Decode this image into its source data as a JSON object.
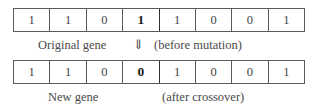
{
  "figure": {
    "colors": {
      "background": "#ffffff",
      "border": "#5b5b5b",
      "text": "#4a4a4a",
      "highlight": "#1d1d1d"
    }
  },
  "original": {
    "label": "Original gene",
    "note": "(before mutation)",
    "arrow_icon": "double-down-arrow",
    "arrow_glyph": "⇓",
    "mutated_index": 3,
    "bits": [
      "1",
      "1",
      "0",
      "1",
      "1",
      "0",
      "0",
      "1"
    ]
  },
  "new": {
    "label": "New gene",
    "note": "(after crossover)",
    "mutated_index": 3,
    "bits": [
      "1",
      "1",
      "0",
      "0",
      "1",
      "0",
      "0",
      "1"
    ]
  }
}
